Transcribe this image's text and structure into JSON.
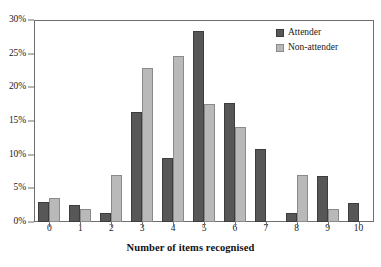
{
  "chart_data": {
    "type": "bar",
    "title": "",
    "xlabel": "Number of items recognised",
    "ylabel": "",
    "categories": [
      "0",
      "1",
      "2",
      "3",
      "4",
      "5",
      "6",
      "7",
      "8",
      "9",
      "10"
    ],
    "series": [
      {
        "name": "Attender",
        "color": "#575757",
        "values": [
          3.0,
          2.6,
          1.3,
          16.3,
          9.5,
          28.3,
          17.7,
          10.8,
          1.4,
          6.8,
          2.8
        ]
      },
      {
        "name": "Non-attender",
        "color": "#b9b9b9",
        "values": [
          3.6,
          1.9,
          7.0,
          22.8,
          24.6,
          17.6,
          14.1,
          0.0,
          7.0,
          1.9,
          0.0
        ]
      }
    ],
    "ylim": [
      0,
      30
    ],
    "yticks": [
      0,
      5,
      10,
      15,
      20,
      25,
      30
    ],
    "ytick_labels": [
      "0%",
      "5%",
      "10%",
      "15%",
      "20%",
      "25%",
      "30%"
    ],
    "grid": false,
    "legend_position": "top-right",
    "frame": true
  },
  "legend": {
    "items": [
      {
        "label": "Attender",
        "swatch": "attender"
      },
      {
        "label": "Non-attender",
        "swatch": "nonattender"
      }
    ]
  }
}
